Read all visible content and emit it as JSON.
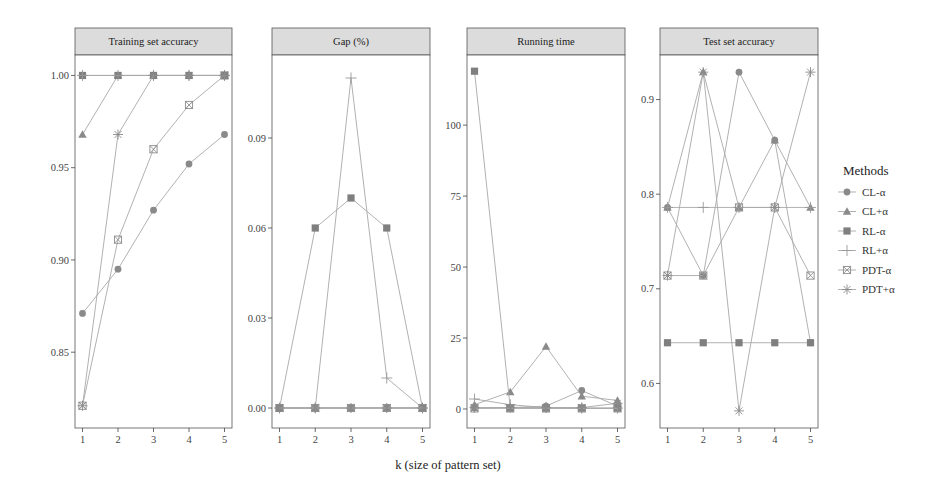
{
  "chart_data": {
    "type": "line",
    "title": "",
    "xlabel": "k (size of pattern set)",
    "x": [
      1,
      2,
      3,
      4,
      5
    ],
    "legend": {
      "title": "Methods",
      "position": "right",
      "entries": [
        {
          "name": "CL-α",
          "marker": "circle"
        },
        {
          "name": "CL+α",
          "marker": "triangle"
        },
        {
          "name": "RL-α",
          "marker": "square"
        },
        {
          "name": "RL+α",
          "marker": "plus"
        },
        {
          "name": "PDT-α",
          "marker": "boxed-x"
        },
        {
          "name": "PDT+α",
          "marker": "asterisk"
        }
      ]
    },
    "facets": [
      {
        "title": "Training set accuracy",
        "ylabel": "",
        "yticks": [
          "0.85",
          "0.90",
          "0.95",
          "1.00"
        ],
        "ylim": [
          0.81,
          1.01
        ],
        "series": [
          {
            "name": "CL-α",
            "values": [
              0.871,
              0.895,
              0.927,
              0.952,
              0.968
            ]
          },
          {
            "name": "CL+α",
            "values": [
              0.968,
              1.0,
              1.0,
              1.0,
              1.0
            ]
          },
          {
            "name": "RL-α",
            "values": [
              1.0,
              1.0,
              1.0,
              1.0,
              1.0
            ]
          },
          {
            "name": "RL+α",
            "values": [
              1.0,
              1.0,
              1.0,
              1.0,
              1.0
            ]
          },
          {
            "name": "PDT-α",
            "values": [
              0.821,
              0.911,
              0.96,
              0.984,
              1.0
            ]
          },
          {
            "name": "PDT+α",
            "values": [
              0.821,
              0.968,
              1.0,
              1.0,
              1.0
            ]
          }
        ]
      },
      {
        "title": "Gap (%)",
        "ylabel": "",
        "yticks": [
          "0.00",
          "0.03",
          "0.06",
          "0.09"
        ],
        "ylim": [
          -0.006,
          0.117
        ],
        "series": [
          {
            "name": "CL-α",
            "values": [
              0,
              0,
              0,
              0,
              0
            ]
          },
          {
            "name": "CL+α",
            "values": [
              0,
              0,
              0,
              0,
              0
            ]
          },
          {
            "name": "RL-α",
            "values": [
              0,
              0.06,
              0.07,
              0.06,
              0
            ]
          },
          {
            "name": "RL+α",
            "values": [
              0,
              0,
              0.11,
              0.01,
              0
            ]
          },
          {
            "name": "PDT-α",
            "values": [
              0,
              0,
              0,
              0,
              0
            ]
          },
          {
            "name": "PDT+α",
            "values": [
              0,
              0,
              0,
              0,
              0
            ]
          }
        ]
      },
      {
        "title": "Running time",
        "ylabel": "",
        "yticks": [
          "0",
          "25",
          "50",
          "75",
          "100"
        ],
        "ylim": [
          -6,
          124
        ],
        "series": [
          {
            "name": "CL-α",
            "values": [
              0.3,
              0.5,
              1,
              6.5,
              1
            ]
          },
          {
            "name": "CL+α",
            "values": [
              1.5,
              6,
              22,
              4.5,
              3
            ]
          },
          {
            "name": "RL-α",
            "values": [
              119,
              0.3,
              0.3,
              0.3,
              0.3
            ]
          },
          {
            "name": "RL+α",
            "values": [
              3.5,
              1.5,
              0.5,
              0.3,
              0.3
            ]
          },
          {
            "name": "PDT-α",
            "values": [
              0.2,
              0.2,
              0.2,
              0.2,
              0.2
            ]
          },
          {
            "name": "PDT+α",
            "values": [
              0.5,
              0.5,
              0.5,
              0.5,
              2
            ]
          }
        ]
      },
      {
        "title": "Test set accuracy",
        "ylabel": "",
        "yticks": [
          "0.6",
          "0.7",
          "0.8",
          "0.9"
        ],
        "ylim": [
          0.555,
          0.945
        ],
        "series": [
          {
            "name": "CL-α",
            "values": [
              0.786,
              0.714,
              0.929,
              0.857,
              0.643
            ]
          },
          {
            "name": "CL+α",
            "values": [
              0.786,
              0.929,
              0.786,
              0.857,
              0.786
            ]
          },
          {
            "name": "RL-α",
            "values": [
              0.643,
              0.643,
              0.643,
              0.643,
              0.643
            ]
          },
          {
            "name": "RL+α",
            "values": [
              0.786,
              0.786,
              0.786,
              0.786,
              0.786
            ]
          },
          {
            "name": "PDT-α",
            "values": [
              0.714,
              0.714,
              0.786,
              0.786,
              0.714
            ]
          },
          {
            "name": "PDT+α",
            "values": [
              0.714,
              0.929,
              0.571,
              0.786,
              0.929
            ]
          }
        ]
      }
    ]
  },
  "colors": {
    "line": "#a8a8a8",
    "marker": "#8a8a8a",
    "strip_bg": "#dcdcdc",
    "panel_border": "#555555"
  }
}
